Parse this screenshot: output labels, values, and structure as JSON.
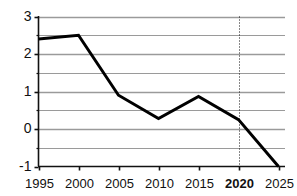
{
  "chart_data": {
    "type": "line",
    "title": "",
    "subtitle": "",
    "xlabel": "",
    "ylabel": "",
    "x": [
      1995,
      2000,
      2005,
      2010,
      2015,
      2020,
      2025
    ],
    "categories": [
      "1995",
      "2000",
      "2005",
      "2010",
      "2015",
      "2020",
      "2025"
    ],
    "values": [
      2.4,
      2.5,
      0.9,
      0.28,
      0.87,
      0.25,
      -1.0
    ],
    "series": [
      {
        "name": "series-1",
        "values": [
          2.4,
          2.5,
          0.9,
          0.28,
          0.87,
          0.25,
          -1.0
        ],
        "color": "#000000"
      }
    ],
    "xlim": [
      1995,
      2025
    ],
    "ylim": [
      -1,
      3
    ],
    "y_major_ticks": [
      3,
      2,
      1,
      0,
      -1
    ],
    "y_major_tick_labels": [
      "3",
      "2",
      "1",
      "0",
      "-1"
    ],
    "y_minor_gridlines": [
      2.5,
      1.5,
      0.5,
      -0.5
    ],
    "x_ticks": [
      1995,
      2000,
      2005,
      2010,
      2015,
      2020,
      2025
    ],
    "x_tick_labels": [
      "1995",
      "2000",
      "2005",
      "2010",
      "2015",
      "2020",
      "2025"
    ],
    "x_tick_bold": [
      false,
      false,
      false,
      false,
      false,
      true,
      false
    ],
    "grid": true,
    "grid_color": "#9a9a9a",
    "axis_color": "#111111",
    "legend": false,
    "legend_position": "none",
    "annotations": [
      {
        "name": "reference-line-2020",
        "type": "vertical-dotted-line",
        "x": 2020,
        "label": "2020",
        "color": "#111111",
        "style": "dotted"
      }
    ],
    "background_color": "#ffffff"
  },
  "axis": {
    "y_labels": [
      "3",
      "2",
      "1",
      "0",
      "-1"
    ],
    "x_labels": [
      "1995",
      "2000",
      "2005",
      "2010",
      "2015",
      "2020",
      "2025"
    ]
  }
}
